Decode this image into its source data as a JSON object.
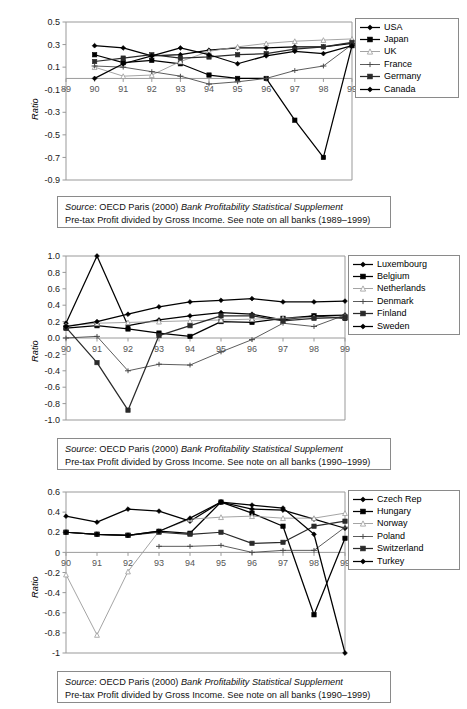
{
  "document": {
    "kind": "three-panel-line-chart-figure",
    "caption_source_prefix": "Source",
    "caption_source_rest": ": OECD Paris (2000) ",
    "caption_source_italic": "Bank Profitability Statistical Supplement"
  },
  "figures": [
    {
      "id": "figure-1",
      "ylabel": "Ratio",
      "caption_line1_prefix": "Source",
      "caption_line1_mid": ": OECD Paris (2000) ",
      "caption_line1_italic": "Bank Profitability Statistical Supplement",
      "caption_line2": "Pre-tax Profit divided by Gross Income. See note on all banks (1989–1999)",
      "legend": [
        {
          "label": "USA",
          "marker": "diamond",
          "color": "#000000"
        },
        {
          "label": "Japan",
          "marker": "square",
          "color": "#000000"
        },
        {
          "label": "UK",
          "marker": "triangle",
          "color": "#9a9a9a"
        },
        {
          "label": "France",
          "marker": "cross",
          "color": "#4a4a4a"
        },
        {
          "label": "Germany",
          "marker": "square",
          "color": "#2a2a2a"
        },
        {
          "label": "Canada",
          "marker": "diamond",
          "color": "#000000"
        }
      ]
    },
    {
      "id": "figure-2",
      "ylabel": "Ratio",
      "caption_line1_prefix": "Source",
      "caption_line1_mid": ": OECD Paris (2000) ",
      "caption_line1_italic": "Bank Profitability Statistical Supplement",
      "caption_line2": "Pre-tax Profit divided by Gross Income. See note on all banks (1990–1999)",
      "legend": [
        {
          "label": "Luxembourg",
          "marker": "diamond",
          "color": "#000000"
        },
        {
          "label": "Belgium",
          "marker": "square",
          "color": "#000000"
        },
        {
          "label": "Netherlands",
          "marker": "triangle",
          "color": "#9a9a9a"
        },
        {
          "label": "Denmark",
          "marker": "cross",
          "color": "#4a4a4a"
        },
        {
          "label": "Finland",
          "marker": "square",
          "color": "#2a2a2a"
        },
        {
          "label": "Sweden",
          "marker": "diamond",
          "color": "#000000"
        }
      ]
    },
    {
      "id": "figure-3",
      "ylabel": "Ratio",
      "caption_line1_prefix": "Source",
      "caption_line1_mid": ": OECD Paris (2000) ",
      "caption_line1_italic": "Bank Profitability Statistical Supplement",
      "caption_line2": "Pre-tax Profit divided by Gross Income. See note on all banks (1990–1999)",
      "legend": [
        {
          "label": "Czech Rep",
          "marker": "diamond",
          "color": "#000000"
        },
        {
          "label": "Hungary",
          "marker": "square",
          "color": "#000000"
        },
        {
          "label": "Norway",
          "marker": "triangle",
          "color": "#9a9a9a"
        },
        {
          "label": "Poland",
          "marker": "cross",
          "color": "#4a4a4a"
        },
        {
          "label": "Switzerland",
          "marker": "square",
          "color": "#2a2a2a"
        },
        {
          "label": "Turkey",
          "marker": "diamond",
          "color": "#000000"
        }
      ]
    }
  ],
  "chart_data": [
    {
      "type": "line",
      "title": "",
      "xlabel": "",
      "ylabel": "Ratio",
      "categories": [
        "89",
        "90",
        "91",
        "92",
        "93",
        "94",
        "95",
        "96",
        "97",
        "98",
        "99"
      ],
      "xticklabels": [
        "89",
        "90",
        "91",
        "92",
        "93",
        "94",
        "95",
        "96",
        "97",
        "98",
        "99"
      ],
      "yticks": [
        -0.9,
        -0.7,
        -0.5,
        -0.3,
        -0.1,
        0.1,
        0.3,
        0.5
      ],
      "yticklabels": [
        "-0.9",
        "-0.7",
        "-0.5",
        "-0.3",
        "-0.1",
        "0.1",
        "0.3",
        "0.5"
      ],
      "ylim": [
        -0.9,
        0.5
      ],
      "grid": false,
      "legend_position": "right",
      "zero_line": true,
      "series": [
        {
          "name": "USA",
          "marker": "diamond",
          "color": "#000000",
          "x": [
            "90",
            "91",
            "92",
            "93",
            "94",
            "95",
            "96",
            "97",
            "98",
            "99"
          ],
          "values": [
            0.29,
            0.27,
            0.2,
            0.21,
            0.25,
            0.27,
            0.27,
            0.28,
            0.28,
            0.31
          ]
        },
        {
          "name": "Japan",
          "marker": "square",
          "color": "#000000",
          "x": [
            "90",
            "91",
            "92",
            "93",
            "94",
            "95",
            "96",
            "97",
            "98",
            "99"
          ],
          "values": [
            0.21,
            0.14,
            0.16,
            0.13,
            0.03,
            0.0,
            0.0,
            -0.37,
            -0.7,
            0.29
          ]
        },
        {
          "name": "UK",
          "marker": "triangle",
          "color": "#9a9a9a",
          "x": [
            "90",
            "91",
            "92",
            "93",
            "94",
            "95",
            "96",
            "97",
            "98",
            "99"
          ],
          "values": [
            0.1,
            0.02,
            0.03,
            0.15,
            0.24,
            0.28,
            0.31,
            0.33,
            0.34,
            0.35
          ]
        },
        {
          "name": "France",
          "marker": "cross",
          "color": "#4a4a4a",
          "x": [
            "90",
            "91",
            "92",
            "93",
            "94",
            "95",
            "96",
            "97",
            "98",
            "99"
          ],
          "values": [
            0.11,
            0.1,
            0.06,
            0.02,
            -0.05,
            -0.03,
            0.0,
            0.07,
            0.11,
            0.3
          ]
        },
        {
          "name": "Germany",
          "marker": "square",
          "color": "#2a2a2a",
          "x": [
            "90",
            "91",
            "92",
            "93",
            "94",
            "95",
            "96",
            "97",
            "98",
            "99"
          ],
          "values": [
            0.15,
            0.18,
            0.21,
            0.18,
            0.19,
            0.21,
            0.22,
            0.26,
            0.28,
            0.32
          ]
        },
        {
          "name": "Canada",
          "marker": "diamond",
          "color": "#000000",
          "x": [
            "90",
            "91",
            "92",
            "93",
            "94",
            "95",
            "96",
            "97",
            "98",
            "99"
          ],
          "values": [
            0.0,
            0.13,
            0.2,
            0.27,
            0.21,
            0.13,
            0.2,
            0.24,
            0.22,
            0.29
          ]
        }
      ]
    },
    {
      "type": "line",
      "title": "",
      "xlabel": "",
      "ylabel": "Ratio",
      "categories": [
        "90",
        "91",
        "92",
        "93",
        "94",
        "95",
        "96",
        "97",
        "98",
        "99"
      ],
      "xticklabels": [
        "90",
        "91",
        "92",
        "93",
        "94",
        "95",
        "96",
        "97",
        "98",
        "99"
      ],
      "yticks": [
        -1.0,
        -0.8,
        -0.6,
        -0.4,
        -0.2,
        0.0,
        0.2,
        0.4,
        0.6,
        0.8,
        1.0
      ],
      "yticklabels": [
        "-1.0",
        "-0.8",
        "-0.6",
        "-0.4",
        "-0.2",
        "0.0",
        "0.2",
        "0.4",
        "0.6",
        "0.8",
        "1.0"
      ],
      "ylim": [
        -1.0,
        1.0
      ],
      "grid": false,
      "legend_position": "right",
      "zero_line": true,
      "series": [
        {
          "name": "Luxembourg",
          "marker": "diamond",
          "color": "#000000",
          "x": [
            "90",
            "91",
            "92",
            "93",
            "94",
            "95",
            "96",
            "97",
            "98",
            "99"
          ],
          "values": [
            0.18,
            1.0,
            0.15,
            0.22,
            0.27,
            0.31,
            0.29,
            0.22,
            0.27,
            0.28
          ]
        },
        {
          "name": "Belgium",
          "marker": "square",
          "color": "#000000",
          "x": [
            "90",
            "91",
            "92",
            "93",
            "94",
            "95",
            "96",
            "97",
            "98",
            "99"
          ],
          "values": [
            0.12,
            0.15,
            0.11,
            0.06,
            0.02,
            0.2,
            0.19,
            0.24,
            0.27,
            0.24
          ]
        },
        {
          "name": "Netherlands",
          "marker": "triangle",
          "color": "#9a9a9a",
          "x": [
            "90",
            "91",
            "92",
            "93",
            "94",
            "95",
            "96",
            "97",
            "98",
            "99"
          ],
          "values": [
            0.15,
            0.18,
            0.19,
            0.2,
            0.21,
            0.22,
            0.23,
            0.24,
            0.25,
            0.26
          ]
        },
        {
          "name": "Denmark",
          "marker": "cross",
          "color": "#4a4a4a",
          "x": [
            "90",
            "91",
            "92",
            "93",
            "94",
            "95",
            "96",
            "97",
            "98",
            "99"
          ],
          "values": [
            0.0,
            0.02,
            -0.4,
            -0.32,
            -0.33,
            -0.17,
            -0.02,
            0.18,
            0.14,
            0.28
          ]
        },
        {
          "name": "Finland",
          "marker": "square",
          "color": "#2a2a2a",
          "x": [
            "90",
            "91",
            "92",
            "93",
            "94",
            "95",
            "96",
            "97",
            "98",
            "99"
          ],
          "values": [
            0.13,
            -0.3,
            -0.88,
            0.03,
            0.15,
            0.27,
            0.27,
            0.21,
            0.24,
            0.25
          ]
        },
        {
          "name": "Sweden",
          "marker": "diamond",
          "color": "#000000",
          "x": [
            "90",
            "91",
            "92",
            "93",
            "94",
            "95",
            "96",
            "97",
            "98",
            "99"
          ],
          "values": [
            0.14,
            0.2,
            0.29,
            0.38,
            0.44,
            0.46,
            0.48,
            0.44,
            0.44,
            0.45
          ]
        }
      ]
    },
    {
      "type": "line",
      "title": "",
      "xlabel": "",
      "ylabel": "Ratio",
      "categories": [
        "90",
        "91",
        "92",
        "93",
        "94",
        "95",
        "96",
        "97",
        "98",
        "99"
      ],
      "xticklabels": [
        "90",
        "91",
        "92",
        "93",
        "94",
        "95",
        "96",
        "97",
        "98",
        "99"
      ],
      "yticks": [
        -1,
        -0.8,
        -0.6,
        -0.4,
        -0.2,
        0,
        0.2,
        0.4,
        0.6
      ],
      "yticklabels": [
        "-1",
        "-0.8",
        "-0.6",
        "-0.4",
        "-0.2",
        "0",
        "0.2",
        "0.4",
        "0.6"
      ],
      "ylim": [
        -1.0,
        0.6
      ],
      "grid": false,
      "legend_position": "right",
      "zero_line": true,
      "series": [
        {
          "name": "Czech Rep",
          "marker": "diamond",
          "color": "#000000",
          "x": [
            "90",
            "91",
            "92",
            "93",
            "94",
            "95",
            "96",
            "97",
            "98",
            "99"
          ],
          "values": [
            0.36,
            0.3,
            0.43,
            0.41,
            0.31,
            0.5,
            0.43,
            0.42,
            0.33,
            0.24
          ]
        },
        {
          "name": "Hungary",
          "marker": "square",
          "color": "#000000",
          "x": [
            "90",
            "91",
            "92",
            "93",
            "94",
            "95",
            "96",
            "97",
            "98",
            "99"
          ],
          "values": [
            0.2,
            0.18,
            0.17,
            0.21,
            0.19,
            0.5,
            0.39,
            0.26,
            -0.62,
            0.14
          ]
        },
        {
          "name": "Norway",
          "marker": "triangle",
          "color": "#9a9a9a",
          "x": [
            "90",
            "91",
            "92",
            "93",
            "94",
            "95",
            "96",
            "97",
            "98",
            "99"
          ],
          "values": [
            -0.22,
            -0.82,
            -0.19,
            0.21,
            0.33,
            0.35,
            0.36,
            0.34,
            0.34,
            0.39
          ]
        },
        {
          "name": "Poland",
          "marker": "cross",
          "color": "#4a4a4a",
          "x": [
            "93",
            "94",
            "95",
            "96",
            "97",
            "98",
            "99"
          ],
          "values": [
            0.06,
            0.06,
            0.07,
            0.0,
            0.02,
            0.02,
            0.25
          ]
        },
        {
          "name": "Switzerland",
          "marker": "square",
          "color": "#2a2a2a",
          "x": [
            "90",
            "91",
            "92",
            "93",
            "94",
            "95",
            "96",
            "97",
            "98",
            "99"
          ],
          "values": [
            0.2,
            0.18,
            0.17,
            0.2,
            0.18,
            0.2,
            0.09,
            0.1,
            0.26,
            0.31
          ]
        },
        {
          "name": "Turkey",
          "marker": "diamond",
          "color": "#000000",
          "x": [
            "90",
            "91",
            "92",
            "93",
            "94",
            "95",
            "96",
            "97",
            "98",
            "99"
          ],
          "values": [
            0.2,
            0.18,
            0.17,
            0.21,
            0.34,
            0.5,
            0.47,
            0.44,
            0.18,
            -1.0
          ]
        }
      ]
    }
  ]
}
